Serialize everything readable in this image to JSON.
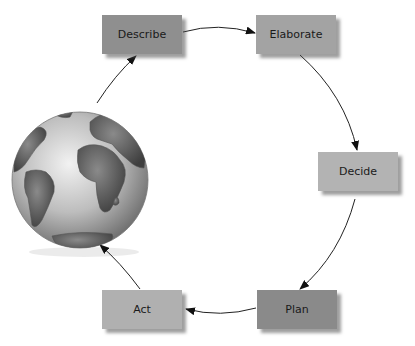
{
  "diagram": {
    "type": "cycle",
    "nodes": [
      {
        "id": "describe",
        "label": "Describe",
        "color": "#8f8f8f",
        "x": 102,
        "y": 15
      },
      {
        "id": "elaborate",
        "label": "Elaborate",
        "color": "#a3a3a3",
        "x": 256,
        "y": 15
      },
      {
        "id": "decide",
        "label": "Decide",
        "color": "#b3b3b3",
        "x": 318,
        "y": 152
      },
      {
        "id": "plan",
        "label": "Plan",
        "color": "#8a8a8a",
        "x": 257,
        "y": 290
      },
      {
        "id": "act",
        "label": "Act",
        "color": "#b0b0b0",
        "x": 102,
        "y": 290
      }
    ],
    "edges": [
      {
        "from": "describe",
        "to": "elaborate"
      },
      {
        "from": "elaborate",
        "to": "decide"
      },
      {
        "from": "decide",
        "to": "plan"
      },
      {
        "from": "plan",
        "to": "act"
      },
      {
        "from": "act",
        "to": "globe"
      },
      {
        "from": "globe",
        "to": "describe"
      }
    ],
    "center_image": "globe-icon"
  }
}
